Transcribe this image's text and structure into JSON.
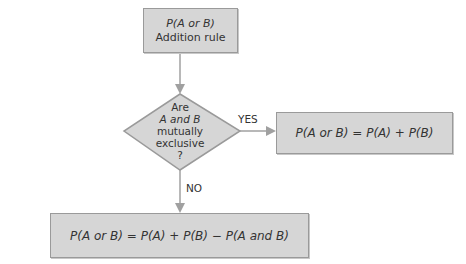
{
  "diagram": {
    "start_box": {
      "line1": "P(A or B)",
      "line2": "Addition rule"
    },
    "decision": {
      "lines": [
        "Are",
        "A and B",
        "mutually",
        "exclusive",
        "?"
      ]
    },
    "yes_branch": {
      "label": "YES",
      "formula": "P(A or B) = P(A) + P(B)"
    },
    "no_branch": {
      "label": "NO",
      "formula": "P(A or B) = P(A) + P(B) − P(A and B)"
    },
    "colors": {
      "box_fill": "#d6d6d6",
      "box_border": "#9a9a9a",
      "arrow": "#999999",
      "text": "#333333"
    }
  }
}
